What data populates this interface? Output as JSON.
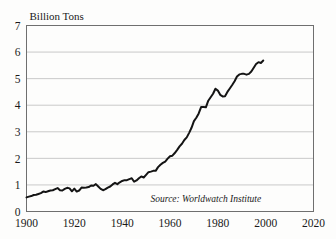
{
  "chart_data": {
    "type": "line",
    "title": "Billion Tons",
    "subtitle": "",
    "xlabel": "",
    "ylabel": "Billion Tons",
    "xlim": [
      1900,
      2020
    ],
    "ylim": [
      0,
      7
    ],
    "grid": true,
    "grid_axis": "y",
    "legend": false,
    "legend_position": "none",
    "xticks": [
      1900,
      1920,
      1940,
      1960,
      1980,
      2000,
      2020
    ],
    "xtick_labels": [
      "1900",
      "1920",
      "1940",
      "1960",
      "1980",
      "2000",
      "2020"
    ],
    "yticks": [
      0,
      1,
      2,
      3,
      4,
      5,
      6,
      7
    ],
    "ytick_labels": [
      "0",
      "1",
      "2",
      "3",
      "4",
      "5",
      "6",
      "7"
    ],
    "annotations": [
      {
        "name": "source-note",
        "text": "Source: Worldwatch Institute",
        "x": 1975,
        "y": 0.35
      }
    ],
    "series": [
      {
        "name": "Carbon Emissions",
        "color": "#141414",
        "x": [
          1900,
          1901,
          1902,
          1903,
          1904,
          1905,
          1906,
          1907,
          1908,
          1909,
          1910,
          1911,
          1912,
          1913,
          1914,
          1915,
          1916,
          1917,
          1918,
          1919,
          1920,
          1921,
          1922,
          1923,
          1924,
          1925,
          1926,
          1927,
          1928,
          1929,
          1930,
          1931,
          1932,
          1933,
          1934,
          1935,
          1936,
          1937,
          1938,
          1939,
          1940,
          1941,
          1942,
          1943,
          1944,
          1945,
          1946,
          1947,
          1948,
          1949,
          1950,
          1951,
          1952,
          1953,
          1954,
          1955,
          1956,
          1957,
          1958,
          1959,
          1960,
          1961,
          1962,
          1963,
          1964,
          1965,
          1966,
          1967,
          1968,
          1969,
          1970,
          1971,
          1972,
          1973,
          1974,
          1975,
          1976,
          1977,
          1978,
          1979,
          1980,
          1981,
          1982,
          1983,
          1984,
          1985,
          1986,
          1987,
          1988,
          1989,
          1990,
          1991,
          1992,
          1993,
          1994,
          1995,
          1996,
          1997,
          1998,
          1999
        ],
        "values": [
          0.53,
          0.56,
          0.58,
          0.62,
          0.63,
          0.66,
          0.69,
          0.75,
          0.73,
          0.76,
          0.79,
          0.8,
          0.84,
          0.88,
          0.8,
          0.79,
          0.85,
          0.89,
          0.87,
          0.76,
          0.86,
          0.75,
          0.79,
          0.9,
          0.89,
          0.9,
          0.92,
          0.98,
          0.97,
          1.03,
          0.94,
          0.85,
          0.8,
          0.84,
          0.9,
          0.94,
          1.02,
          1.08,
          1.03,
          1.1,
          1.15,
          1.18,
          1.18,
          1.22,
          1.25,
          1.12,
          1.17,
          1.25,
          1.32,
          1.28,
          1.38,
          1.48,
          1.5,
          1.53,
          1.53,
          1.67,
          1.76,
          1.83,
          1.88,
          1.99,
          2.08,
          2.1,
          2.2,
          2.32,
          2.45,
          2.55,
          2.69,
          2.79,
          2.96,
          3.15,
          3.4,
          3.53,
          3.69,
          3.93,
          3.93,
          3.92,
          4.17,
          4.3,
          4.43,
          4.62,
          4.55,
          4.39,
          4.33,
          4.34,
          4.5,
          4.63,
          4.76,
          4.9,
          5.08,
          5.16,
          5.18,
          5.18,
          5.15,
          5.18,
          5.27,
          5.41,
          5.55,
          5.62,
          5.59,
          5.68
        ]
      }
    ]
  },
  "frame": {
    "border_color": "#6f6f6f",
    "grid_color": "#c9c9c9",
    "background": "#fdfdfc"
  }
}
